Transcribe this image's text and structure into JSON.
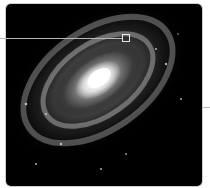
{
  "figure": {
    "subject": "Spiral galaxy",
    "description": "Grayscale photograph of a face-tilted spiral galaxy with bright core and dusty spiral arms",
    "colors": {
      "background": "#000000",
      "core": "#ffffff",
      "arms": "#9a9a9a",
      "callout": "#b8b8b8",
      "border": "#cfcfcf"
    },
    "annotations": {
      "callout_marker": "square-marker",
      "right_tick": "tick-mark"
    }
  }
}
